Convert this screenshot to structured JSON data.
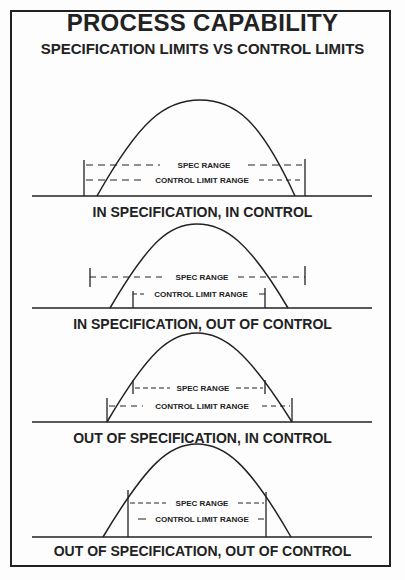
{
  "header": {
    "title": "PROCESS CAPABILITY",
    "subtitle": "SPECIFICATION LIMITS VS CONTROL LIMITS"
  },
  "labels": {
    "spec": "SPEC RANGE",
    "control": "CONTROL LIMIT RANGE"
  },
  "panels": [
    {
      "caption": "IN SPECIFICATION, IN CONTROL",
      "spec_limits": [
        84,
        305
      ],
      "control_limits": [
        84,
        305
      ],
      "curve": [
        97,
        295
      ]
    },
    {
      "caption": "IN SPECIFICATION, OUT OF CONTROL",
      "spec_limits": [
        90,
        305
      ],
      "control_limits": [
        133,
        265
      ],
      "curve": [
        110,
        288
      ]
    },
    {
      "caption": "OUT OF SPECIFICATION, IN CONTROL",
      "spec_limits": [
        133,
        265
      ],
      "control_limits": [
        107,
        292
      ],
      "curve": [
        107,
        292
      ]
    },
    {
      "caption": "OUT OF SPECIFICATION, OUT OF CONTROL",
      "spec_limits": [
        128,
        266
      ],
      "control_limits": [
        128,
        266
      ],
      "curve": [
        103,
        291
      ]
    }
  ],
  "colors": {
    "ink": "#222222",
    "background": "#fdfdfd"
  }
}
